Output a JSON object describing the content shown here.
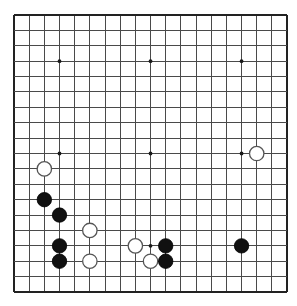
{
  "board": {
    "name": "go-board",
    "size": 19,
    "columns": 19,
    "rows": 19,
    "origin_x": 14,
    "origin_y": 15,
    "spacing_x": 15.17,
    "spacing_y": 15.39,
    "line_color": "#4a4a4a",
    "edge_color": "#222222",
    "background_color": "#ffffff",
    "stone_radius": 7.2,
    "hoshi_radius": 1.9,
    "hoshi_points": [
      {
        "col": 3,
        "row": 3
      },
      {
        "col": 9,
        "row": 3
      },
      {
        "col": 15,
        "row": 3
      },
      {
        "col": 3,
        "row": 9
      },
      {
        "col": 9,
        "row": 9
      },
      {
        "col": 15,
        "row": 9
      },
      {
        "col": 3,
        "row": 15
      },
      {
        "col": 9,
        "row": 15
      },
      {
        "col": 15,
        "row": 15
      }
    ]
  },
  "stones": [
    {
      "color": "white",
      "col": 16,
      "row": 9,
      "label": "white-stone-q10"
    },
    {
      "color": "white",
      "col": 2,
      "row": 10,
      "label": "white-stone-c9"
    },
    {
      "color": "black",
      "col": 2,
      "row": 12,
      "label": "black-stone-c7"
    },
    {
      "color": "black",
      "col": 3,
      "row": 13,
      "label": "black-stone-d6"
    },
    {
      "color": "white",
      "col": 5,
      "row": 14,
      "label": "white-stone-f5"
    },
    {
      "color": "black",
      "col": 3,
      "row": 15,
      "label": "black-stone-d4"
    },
    {
      "color": "white",
      "col": 8,
      "row": 15,
      "label": "white-stone-j4"
    },
    {
      "color": "black",
      "col": 10,
      "row": 15,
      "label": "black-stone-l4"
    },
    {
      "color": "black",
      "col": 15,
      "row": 15,
      "label": "black-stone-q4"
    },
    {
      "color": "black",
      "col": 3,
      "row": 16,
      "label": "black-stone-d3"
    },
    {
      "color": "white",
      "col": 5,
      "row": 16,
      "label": "white-stone-f3"
    },
    {
      "color": "white",
      "col": 9,
      "row": 16,
      "label": "white-stone-k3"
    },
    {
      "color": "black",
      "col": 10,
      "row": 16,
      "label": "black-stone-l3"
    }
  ],
  "counts": {
    "black_stones": 7,
    "white_stones": 6,
    "total_stones": 13
  }
}
